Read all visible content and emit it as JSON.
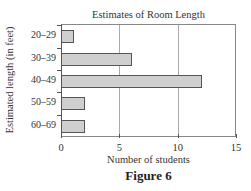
{
  "chart_data": {
    "type": "bar",
    "orientation": "horizontal",
    "title": "Estimates of Room Length",
    "xlabel": "Number of students",
    "ylabel": "Estimated length (in feet)",
    "categories": [
      "20–29",
      "30–39",
      "40–49",
      "50–59",
      "60–69"
    ],
    "values": [
      1,
      6,
      12,
      2,
      2
    ],
    "xlim": [
      0,
      15
    ],
    "xticks": [
      "0",
      "5",
      "10",
      "15"
    ],
    "grid": "vertical gridlines at 5 and 10",
    "legend": null,
    "bar_color": "#cfcfcf",
    "bar_edge_color": "#555555"
  },
  "caption": "Figure 6"
}
